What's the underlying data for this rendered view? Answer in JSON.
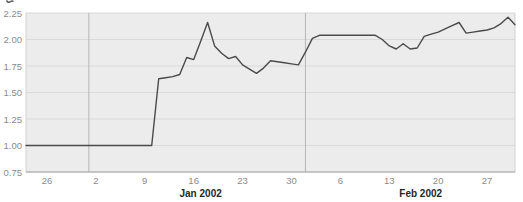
{
  "chart_data": {
    "type": "line",
    "title": "",
    "xlabel": "",
    "ylabel": "",
    "ylim": [
      0.75,
      2.25
    ],
    "grid": "horizontal-on, vertical-only-at-month-boundaries",
    "legend": "none",
    "x_dates": [
      "Dec 23",
      "Dec 24",
      "Dec 25",
      "Dec 26",
      "Dec 27",
      "Dec 28",
      "Dec 29",
      "Dec 30",
      "Dec 31",
      "Jan 1",
      "Jan 2",
      "Jan 3",
      "Jan 4",
      "Jan 5",
      "Jan 6",
      "Jan 7",
      "Jan 8",
      "Jan 9",
      "Jan 10",
      "Jan 11",
      "Jan 12",
      "Jan 13",
      "Jan 14",
      "Jan 15",
      "Jan 16",
      "Jan 17",
      "Jan 18",
      "Jan 19",
      "Jan 20",
      "Jan 21",
      "Jan 22",
      "Jan 23",
      "Jan 24",
      "Jan 25",
      "Jan 26",
      "Jan 27",
      "Jan 28",
      "Jan 29",
      "Jan 30",
      "Jan 31",
      "Feb 1",
      "Feb 2",
      "Feb 3",
      "Feb 4",
      "Feb 5",
      "Feb 6",
      "Feb 7",
      "Feb 8",
      "Feb 9",
      "Feb 10",
      "Feb 11",
      "Feb 12",
      "Feb 13",
      "Feb 14",
      "Feb 15",
      "Feb 16",
      "Feb 17",
      "Feb 18",
      "Feb 19",
      "Feb 20",
      "Feb 21",
      "Feb 22",
      "Feb 23",
      "Feb 24",
      "Feb 25",
      "Feb 26",
      "Feb 27",
      "Feb 28",
      "Mar 1",
      "Mar 2",
      "Mar 3"
    ],
    "values": [
      1.0,
      1.0,
      1.0,
      1.0,
      1.0,
      1.0,
      1.0,
      1.0,
      1.0,
      1.0,
      1.0,
      1.0,
      1.0,
      1.0,
      1.0,
      1.0,
      1.0,
      1.0,
      1.0,
      1.63,
      1.64,
      1.65,
      1.67,
      1.83,
      1.81,
      1.98,
      2.16,
      1.94,
      1.87,
      1.82,
      1.84,
      1.76,
      1.72,
      1.68,
      1.73,
      1.8,
      1.79,
      1.78,
      1.77,
      1.76,
      1.88,
      2.01,
      2.04,
      2.04,
      2.04,
      2.04,
      2.04,
      2.04,
      2.04,
      2.04,
      2.04,
      2.0,
      1.94,
      1.91,
      1.96,
      1.91,
      1.92,
      2.03,
      2.05,
      2.07,
      2.1,
      2.13,
      2.16,
      2.06,
      2.07,
      2.08,
      2.09,
      2.11,
      2.15,
      2.21,
      2.14
    ],
    "y_ticks": [
      {
        "value": 0.75,
        "label": "0.75"
      },
      {
        "value": 1.0,
        "label": "1.00"
      },
      {
        "value": 1.25,
        "label": "1.25"
      },
      {
        "value": 1.5,
        "label": "1.50"
      },
      {
        "value": 1.75,
        "label": "1.75"
      },
      {
        "value": 2.0,
        "label": "2.00"
      },
      {
        "value": 2.25,
        "label": "2.25"
      }
    ],
    "x_ticks": [
      {
        "index": 3,
        "label": "26"
      },
      {
        "index": 10,
        "label": "2"
      },
      {
        "index": 17,
        "label": "9"
      },
      {
        "index": 24,
        "label": "16"
      },
      {
        "index": 31,
        "label": "23"
      },
      {
        "index": 38,
        "label": "30"
      },
      {
        "index": 45,
        "label": "6"
      },
      {
        "index": 52,
        "label": "13"
      },
      {
        "index": 59,
        "label": "20"
      },
      {
        "index": 66,
        "label": "27"
      }
    ],
    "month_labels": [
      {
        "label": "Jan 2002",
        "anchor_index": 25
      },
      {
        "label": "Feb 2002",
        "anchor_index": 56.5
      }
    ],
    "month_divider_indices": [
      9,
      40
    ],
    "colors": {
      "plot_background": "#ececec",
      "horizontal_grid": "#d9d9d9",
      "month_divider": "#b6b6b6",
      "bottom_axis": "#a3a3a3",
      "plot_border": "#d2d2d2",
      "series_line": "#4a4a4a",
      "tick_text": "#8b8b8b",
      "month_text": "#262626"
    }
  }
}
